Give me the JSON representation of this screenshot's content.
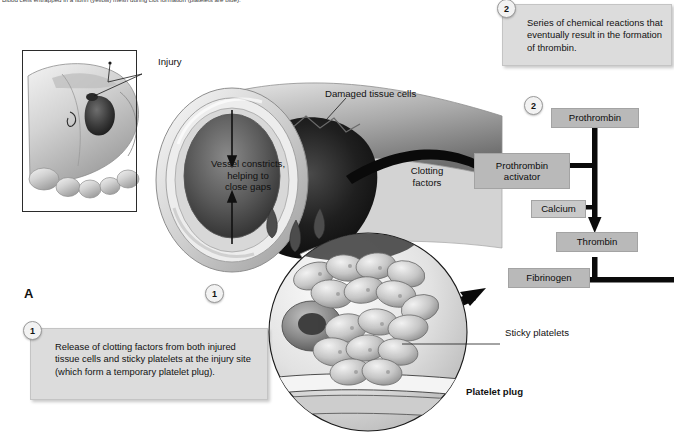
{
  "figure": {
    "top_caption": "Blood cells entrapped in a fibrin (yellow) mesh during clot formation (platelets are blue).",
    "panel_letter": "A",
    "accent_box_fill": "#b9b9b9",
    "callout_fill": "#dcdcdc",
    "line_color": "#111111"
  },
  "callouts": [
    {
      "number": "1",
      "text": "Release of clotting factors from both injured tissue cells and sticky platelets at the injury site (which form a temporary platelet plug)."
    },
    {
      "number": "2",
      "text": "Series of chemical reactions that eventually result in the formation of thrombin."
    }
  ],
  "markers": [
    {
      "number": "1"
    },
    {
      "number": "2"
    }
  ],
  "art_labels": [
    {
      "name": "injury",
      "text": "Injury"
    },
    {
      "name": "damaged-tissue-cells",
      "text": "Damaged tissue cells"
    },
    {
      "name": "vessel-constricts",
      "text": "Vessel constricts,\nhelping to\nclose gaps"
    },
    {
      "name": "clotting-factors",
      "text": "Clotting\nfactors"
    },
    {
      "name": "sticky-platelets",
      "text": "Sticky platelets"
    },
    {
      "name": "platelet-plug",
      "text": "Platelet plug"
    }
  ],
  "vessel_label_lines": {
    "line1": "Vessel constricts,",
    "line2": "helping to",
    "line3": "close gaps"
  },
  "clotting_label_lines": {
    "line1": "Clotting",
    "line2": "factors"
  },
  "flowchart": {
    "nodes": [
      {
        "id": "prothrombin",
        "label": "Prothrombin"
      },
      {
        "id": "prothrombin-activator",
        "label": "Prothrombin\nactivator"
      },
      {
        "id": "calcium",
        "label": "Calcium"
      },
      {
        "id": "thrombin",
        "label": "Thrombin"
      },
      {
        "id": "fibrinogen",
        "label": "Fibrinogen"
      }
    ],
    "prothrombin_activator_line1": "Prothrombin",
    "prothrombin_activator_line2": "activator"
  }
}
